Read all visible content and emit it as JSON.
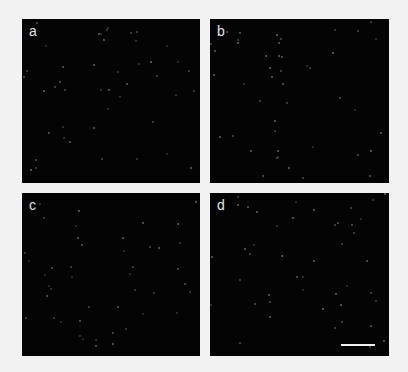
{
  "figure": {
    "background": "#f2f2f2",
    "panels": [
      {
        "id": "a",
        "label": "a",
        "x": 22,
        "y": 19,
        "w": 178,
        "h": 164
      },
      {
        "id": "b",
        "label": "b",
        "x": 210,
        "y": 19,
        "w": 179,
        "h": 164
      },
      {
        "id": "c",
        "label": "c",
        "x": 22,
        "y": 193,
        "w": 178,
        "h": 163
      },
      {
        "id": "d",
        "label": "d",
        "x": 210,
        "y": 193,
        "w": 179,
        "h": 163
      }
    ],
    "scale_bar": {
      "panel": "d",
      "x": 131,
      "y": 151,
      "w": 34
    }
  }
}
